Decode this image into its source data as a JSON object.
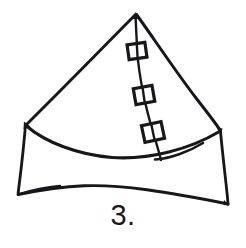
{
  "figure": {
    "caption": "3.",
    "ink_color": "#17161a",
    "background_color": "#ffffff",
    "paper_width": 246,
    "paper_height": 248,
    "medium": "pen-and-ink line drawing",
    "geometry": {
      "apex": {
        "x": 135,
        "y": 13
      },
      "left_shoulder": {
        "x": 25,
        "y": 124
      },
      "right_shoulder": {
        "x": 220,
        "y": 130
      },
      "left_base": {
        "x": 18,
        "y": 194
      },
      "right_base": {
        "x": 228,
        "y": 204
      },
      "front_rim_low_point": {
        "x": 120,
        "y": 157
      },
      "base_rim_low_point": {
        "x": 120,
        "y": 186
      },
      "seam_end": {
        "x": 161,
        "y": 160
      }
    },
    "strokes": [
      {
        "name": "left-slant-edge",
        "description": "straight edge from apex down-left to left shoulder"
      },
      {
        "name": "right-slant-edge",
        "description": "slightly bowed edge from apex down-right to right shoulder"
      },
      {
        "name": "front-rim-curve",
        "description": "curved rim sagging between the two shoulders"
      },
      {
        "name": "left-side-wall",
        "description": "near-vertical wall from left shoulder to left base"
      },
      {
        "name": "right-side-wall",
        "description": "near-vertical wall from right shoulder to right base"
      },
      {
        "name": "base-rim-curve",
        "description": "curved bottom edge bowing downward between base corners"
      },
      {
        "name": "seam-line",
        "description": "line running from apex down the front face to the rim"
      }
    ],
    "markers": [
      {
        "id": 1,
        "label": "square-marker-upper",
        "x": 137,
        "y": 51,
        "width": 18,
        "height": 15,
        "rotation": -8
      },
      {
        "id": 2,
        "label": "square-marker-middle",
        "x": 144,
        "y": 95,
        "width": 19,
        "height": 16,
        "rotation": -10
      },
      {
        "id": 3,
        "label": "square-marker-lower",
        "x": 153,
        "y": 132,
        "width": 20,
        "height": 17,
        "rotation": -12
      }
    ],
    "marker_count": 3
  }
}
